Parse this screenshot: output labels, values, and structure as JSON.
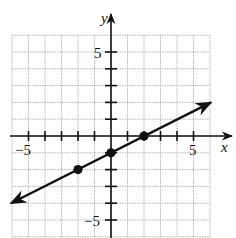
{
  "chart_data": {
    "type": "line",
    "title": "",
    "xlabel": "x",
    "ylabel": "y",
    "xlim": [
      -6,
      6
    ],
    "ylim": [
      -6,
      6
    ],
    "grid": true,
    "x_tick_labels": [
      "-5",
      "5"
    ],
    "y_tick_labels": [
      "5",
      "-5"
    ],
    "line": {
      "equation": "y = x/2 - 1",
      "slope": 0.5,
      "intercept": -1,
      "arrows": "both",
      "x_range": [
        -6,
        6
      ]
    },
    "points": [
      {
        "x": -2,
        "y": -2
      },
      {
        "x": 0,
        "y": -1
      },
      {
        "x": 2,
        "y": 0
      }
    ]
  },
  "labels": {
    "x_axis": "x",
    "y_axis": "y",
    "x_neg5": "−5",
    "x_pos5": "5",
    "y_pos5": "5",
    "y_neg5": "−5"
  },
  "colors": {
    "grid": "#b5b5b5",
    "axis": "#111111",
    "line": "#111111"
  }
}
